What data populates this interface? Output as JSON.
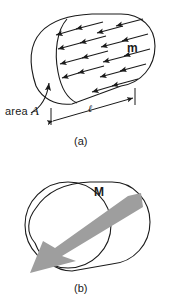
{
  "figure": {
    "background_color": "#ffffff",
    "stroke_color": "#1a1a1a",
    "arrow_fill_color": "#9e9e9e",
    "panels": [
      {
        "id": "a",
        "caption": "(a)",
        "description": "Cylinder containing many small magnetic moment vectors",
        "labels": {
          "moment": "m",
          "area_prefix": "area",
          "area_symbol": "A",
          "length_symbol": "ℓ"
        },
        "moment_arrow_count": 18,
        "moment_arrow_direction": "left-and-slightly-down"
      },
      {
        "id": "b",
        "caption": "(b)",
        "description": "Cylinder with one large magnetization vector",
        "labels": {
          "magnetization": "M"
        },
        "magnetization_arrow_direction": "left-and-slightly-down",
        "magnetization_arrow_color": "#9e9e9e"
      }
    ]
  }
}
